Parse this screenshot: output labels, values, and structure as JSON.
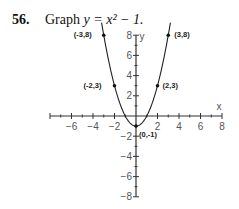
{
  "problem": {
    "number": "56.",
    "text": "Graph",
    "equation": "y = x² − 1."
  },
  "chart_data": {
    "type": "line",
    "function": "y = x^2 - 1",
    "xlabel": "x",
    "ylabel": "y",
    "xlim": [
      -8,
      8
    ],
    "ylim": [
      -8,
      8
    ],
    "x_ticks": [
      -6,
      -4,
      -2,
      2,
      4,
      6,
      8
    ],
    "y_ticks": [
      8,
      6,
      4,
      2,
      -2,
      -4,
      -6,
      -8
    ],
    "grid": false,
    "series": [
      {
        "name": "y = x^2 - 1",
        "x": [
          -3,
          -2,
          -1,
          0,
          1,
          2,
          3
        ],
        "y": [
          8,
          3,
          0,
          -1,
          0,
          3,
          8
        ]
      }
    ],
    "annotations": [
      {
        "label": "(-3,8)",
        "x": -3,
        "y": 8
      },
      {
        "label": "(3,8)",
        "x": 3,
        "y": 8
      },
      {
        "label": "(-2,3)",
        "x": -2,
        "y": 3
      },
      {
        "label": "(2,3)",
        "x": 2,
        "y": 3
      },
      {
        "label": "(0,-1)",
        "x": 0,
        "y": -1
      }
    ]
  }
}
